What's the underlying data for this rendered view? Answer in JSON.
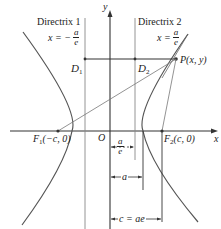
{
  "diagram": {
    "axes": {
      "x_label": "x",
      "y_label": "y",
      "origin_label": "O"
    },
    "directrix1": {
      "label": "Directrix 1",
      "eq_lhs": "x = −",
      "eq_num": "a",
      "eq_den": "e"
    },
    "directrix2": {
      "label": "Directrix 2",
      "eq_lhs": "x =",
      "eq_num": "a",
      "eq_den": "e"
    },
    "points": {
      "D1": {
        "main": "D",
        "sub": "1"
      },
      "D2": {
        "main": "D",
        "sub": "2"
      },
      "P": {
        "label": "P(x, y)"
      },
      "F1": {
        "main": "F",
        "sub": "1",
        "coords": "(−c, 0)"
      },
      "F2": {
        "main": "F",
        "sub": "2",
        "coords": "(c, 0)"
      }
    },
    "dimensions": {
      "a_over_e": {
        "num": "a",
        "den": "e"
      },
      "a": {
        "label": "a"
      },
      "c": {
        "label": "c = ae"
      }
    }
  },
  "colors": {
    "line": "#333333",
    "curve": "#555555",
    "light": "#888888"
  }
}
